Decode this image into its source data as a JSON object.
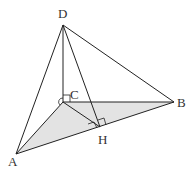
{
  "diagram": {
    "type": "tetrahedron",
    "points": {
      "A": {
        "x": 16,
        "y": 154
      },
      "B": {
        "x": 174,
        "y": 102
      },
      "C": {
        "x": 63,
        "y": 102
      },
      "D": {
        "x": 63,
        "y": 25
      },
      "H": {
        "x": 100,
        "y": 127
      }
    },
    "labels": {
      "A": "A",
      "B": "B",
      "C": "C",
      "D": "D",
      "H": "H"
    },
    "shaded_face": "ABC",
    "colors": {
      "stroke": "#222222",
      "shade": "#e3e3e3"
    },
    "right_angles": [
      "DCA/DCB at C",
      "CH ⟂ AB at H",
      "DH ⟂ AB at H"
    ]
  }
}
